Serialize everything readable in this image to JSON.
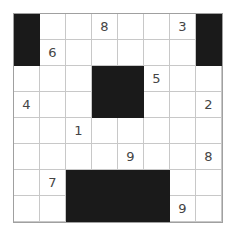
{
  "puzzle": {
    "rows": 8,
    "cols": 8,
    "colors": {
      "black": "#1a1a1a",
      "grid_line": "#c8c8c8",
      "digit": "#444444"
    },
    "cells": [
      [
        "#",
        "",
        "",
        "8",
        "",
        "",
        "3",
        "#"
      ],
      [
        "#",
        "6",
        "",
        "",
        "",
        "",
        "",
        "#"
      ],
      [
        "",
        "",
        "",
        "#",
        "#",
        "5",
        "",
        ""
      ],
      [
        "4",
        "",
        "",
        "#",
        "#",
        "",
        "",
        "2"
      ],
      [
        "",
        "",
        "1",
        "",
        "",
        "",
        "",
        ""
      ],
      [
        "",
        "",
        "",
        "",
        "9",
        "",
        "",
        "8"
      ],
      [
        "",
        "7",
        "#",
        "#",
        "#",
        "#",
        "",
        ""
      ],
      [
        "",
        "",
        "#",
        "#",
        "#",
        "#",
        "9",
        ""
      ]
    ]
  }
}
